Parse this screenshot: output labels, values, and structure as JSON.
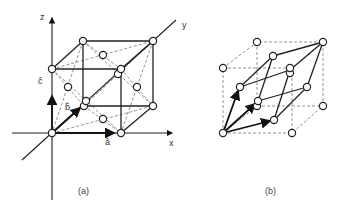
{
  "figure": {
    "panels": [
      {
        "id": "a",
        "caption": "(a)",
        "description": "Face-centered cubic unit cell with Cartesian axes and unit vectors",
        "axis_labels": {
          "x": "x",
          "y": "y",
          "z": "z"
        },
        "vector_labels": {
          "a": "â",
          "b": "b̂",
          "c": "ĉ"
        }
      },
      {
        "id": "b",
        "caption": "(b)",
        "description": "Primitive rhombohedral cell inscribed in the face-centered cubic cell"
      }
    ],
    "colors": {
      "line": "#222222",
      "dashed": "#777777",
      "atom_fill": "#ffffff",
      "background": "#ffffff"
    }
  }
}
